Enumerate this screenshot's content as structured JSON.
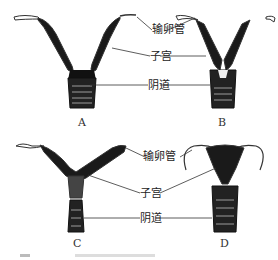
{
  "figure": {
    "panels": [
      {
        "id": "A",
        "label": "A"
      },
      {
        "id": "B",
        "label": "B"
      },
      {
        "id": "C",
        "label": "C"
      },
      {
        "id": "D",
        "label": "D"
      }
    ],
    "top_labels": {
      "oviduct": "输卵管",
      "uterus": "子宫",
      "vagina": "阴道"
    },
    "bottom_labels": {
      "oviduct": "输卵管",
      "uterus": "子宫",
      "vagina": "阴道"
    },
    "caption": ""
  }
}
